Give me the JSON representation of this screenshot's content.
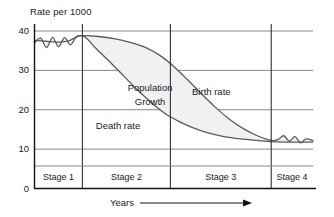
{
  "chart_data": {
    "type": "line",
    "title": "",
    "ylabel": "Rate per 1000",
    "xlabel": "Years",
    "ylim": [
      0,
      42
    ],
    "yticks": [
      0,
      10,
      20,
      30,
      40
    ],
    "ytick_labels": [
      "0",
      "10",
      "20",
      "30",
      "40"
    ],
    "grid": true,
    "legend": "inline-annotations",
    "xaxis_arrow": true,
    "stages": [
      {
        "label": "Stage 1",
        "x_start": 0,
        "x_end": 17.2
      },
      {
        "label": "Stage 2",
        "x_start": 17.2,
        "x_end": 48.8
      },
      {
        "label": "Stage 3",
        "x_start": 48.8,
        "x_end": 85.0
      },
      {
        "label": "Stage 4",
        "x_start": 85.0,
        "x_end": 100
      }
    ],
    "annotations": [
      {
        "text": "Population",
        "x": 41.5,
        "y": 25.5
      },
      {
        "text": "Growth",
        "x": 41.5,
        "y": 22.0
      },
      {
        "text": "Birth rate",
        "x": 63.5,
        "y": 24.5
      },
      {
        "text": "Death rate",
        "x": 30.0,
        "y": 16.0
      }
    ],
    "series": [
      {
        "name": "Birth rate",
        "color": "#5a5a5a",
        "x": [
          0,
          2.2,
          4.3,
          6.5,
          8.6,
          10.8,
          12.9,
          15.1,
          17.2,
          23,
          29,
          34,
          40,
          45,
          50,
          55,
          60,
          65,
          70,
          75,
          80,
          85,
          87.5,
          89.5,
          91.5,
          93.5,
          95.5,
          97.5,
          100
        ],
        "y": [
          37.0,
          38.2,
          35.8,
          38.4,
          36.0,
          38.3,
          36.5,
          38.6,
          38.8,
          38.6,
          38.0,
          37.2,
          35.8,
          33.8,
          31.0,
          27.6,
          24.0,
          20.6,
          17.6,
          15.2,
          13.4,
          12.2,
          12.5,
          13.4,
          12.0,
          13.2,
          11.6,
          12.6,
          12.2
        ]
      },
      {
        "name": "Death rate",
        "color": "#5a5a5a",
        "x": [
          0,
          4,
          8,
          12,
          17.2,
          22,
          27,
          32,
          37,
          42,
          47,
          52,
          57,
          62,
          68,
          74,
          80,
          85,
          90,
          95,
          100
        ],
        "y": [
          37.6,
          37.4,
          37.2,
          37.4,
          38.8,
          35.6,
          32.2,
          28.6,
          25.0,
          21.8,
          19.0,
          17.0,
          15.4,
          14.2,
          13.2,
          12.6,
          12.2,
          11.9,
          11.8,
          11.8,
          11.8
        ]
      }
    ],
    "fill": {
      "between": [
        "Birth rate",
        "Death rate"
      ],
      "label": "Population Growth",
      "color": "#f1f1f1"
    }
  },
  "axes": {
    "y_axis_title": "Rate per 1000",
    "x_axis_title": "Years"
  },
  "colors": {
    "curve": "#5a5a5a",
    "grid": "#888888",
    "axis": "#111111",
    "fill": "#f1f1f1",
    "text": "#1a1a1a"
  }
}
